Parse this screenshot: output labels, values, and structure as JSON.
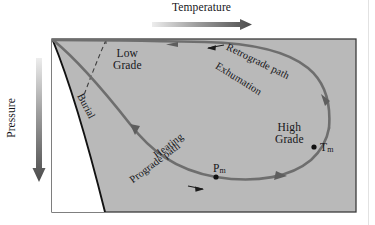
{
  "diagram": {
    "type": "pressure-temperature-time-path",
    "axes": {
      "x": {
        "title": "Temperature",
        "direction": "increasing-right",
        "arrow": "gradient-arrow-right"
      },
      "y": {
        "title": "Pressure",
        "direction": "increasing-down",
        "arrow": "gradient-arrow-down"
      }
    },
    "labels": {
      "low_grade_line1": "Low",
      "low_grade_line2": "Grade",
      "high_grade_line1": "High",
      "high_grade_line2": "Grade",
      "burial": "Burial",
      "retrograde_path": "Retrograde path",
      "exhumation": "Exhumation",
      "heating": "Heating",
      "prograde_path": "Prograde path",
      "t_max": "T",
      "t_max_sub": "m",
      "p_max": "P",
      "p_max_sub": "m"
    },
    "markers": [
      {
        "name": "p-max-point",
        "label": "Pm",
        "x": 216,
        "y": 177
      },
      {
        "name": "t-max-point",
        "label": "Tm",
        "x": 314,
        "y": 147
      }
    ],
    "colors": {
      "plot_fill": "#b9b9b9",
      "frame_stroke": "#3b3b3b",
      "path_stroke": "#6e6e6e",
      "geotherm_stroke": "#121212",
      "dashed_stroke": "#4a4a4a",
      "text": "#16161a",
      "page_background": "#ffffff",
      "arrow_gradient_light": "#e8e8e8",
      "arrow_gradient_dark": "#4c4c4c"
    },
    "frame": {
      "x": 52,
      "y": 39,
      "width": 304,
      "height": 173
    },
    "path_arrows": [
      {
        "name": "retrograde-arrow-top",
        "direction": "left"
      },
      {
        "name": "retrograde-arrow-right-upper",
        "direction": "up"
      },
      {
        "name": "burial-arrow",
        "direction": "down-right"
      },
      {
        "name": "prograde-arrow-bottom-right",
        "direction": "right"
      }
    ],
    "inline_arrows": [
      {
        "name": "retrograde-path-arrow",
        "direction": "left"
      },
      {
        "name": "prograde-path-arrow",
        "direction": "right"
      }
    ]
  }
}
